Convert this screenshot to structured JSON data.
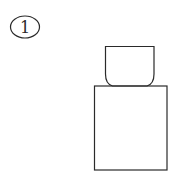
{
  "figure": {
    "label": "1",
    "stroke_color": "#2a2a2a",
    "background": "#ffffff",
    "shapes": {
      "cap": "rounded-bottom cap",
      "body": "rectangular body"
    }
  }
}
